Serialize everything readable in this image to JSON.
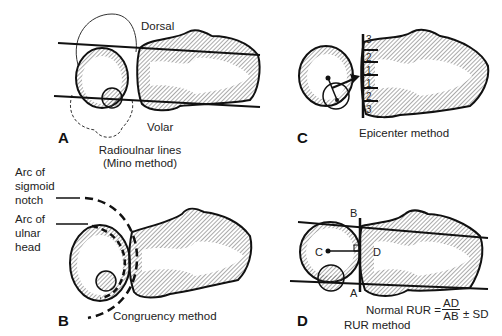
{
  "figure": {
    "panels": [
      {
        "id": "A",
        "letter": "A",
        "labels": {
          "top": "Dorsal",
          "bottom": "Volar"
        },
        "caption_line1": "Radioulnar lines",
        "caption_line2": "(Mino method)"
      },
      {
        "id": "B",
        "letter": "B",
        "side_labels": {
          "sigmoid": [
            "Arc of",
            "sigmoid",
            "notch"
          ],
          "ulnar": [
            "Arc of",
            "ulnar",
            "head"
          ]
        },
        "caption": "Congruency method"
      },
      {
        "id": "C",
        "letter": "C",
        "scale_numbers": [
          "3",
          "2",
          "1",
          "1",
          "2",
          "3"
        ],
        "caption": "Epicenter method"
      },
      {
        "id": "D",
        "letter": "D",
        "point_labels": {
          "B": "B",
          "C": "C",
          "D": "D",
          "A": "A"
        },
        "formula": {
          "prefix": "Normal RUR =",
          "numerator": "AD",
          "denominator": "AB",
          "suffix": "± SD"
        },
        "caption": "RUR method"
      }
    ]
  }
}
